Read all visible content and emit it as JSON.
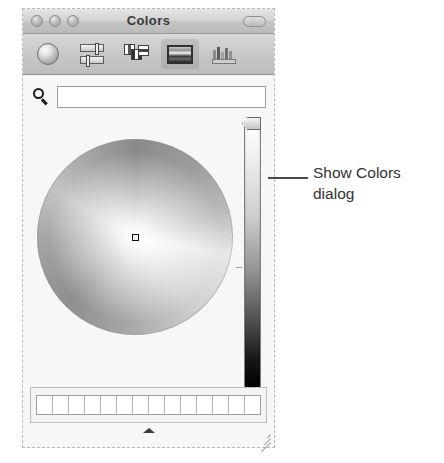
{
  "window": {
    "title": "Colors",
    "traffic_lights": [
      "close-button",
      "minimize-button",
      "zoom-button"
    ],
    "toolbar_toggle": "toolbar-pill-button"
  },
  "toolbar": {
    "items": [
      {
        "name": "color-wheel-icon",
        "label": "Color Wheel",
        "selected": false
      },
      {
        "name": "color-sliders-icon",
        "label": "Color Sliders",
        "selected": false
      },
      {
        "name": "color-palettes-icon",
        "label": "Color Palettes",
        "selected": false
      },
      {
        "name": "image-palettes-icon",
        "label": "Image Palettes",
        "selected": true
      },
      {
        "name": "pencils-icon",
        "label": "Pencils",
        "selected": false
      }
    ]
  },
  "search": {
    "icon": "search-icon",
    "value": "",
    "placeholder": ""
  },
  "color_wheel": {
    "name": "color-wheel-picker",
    "picker_marker": "color-picker-marker",
    "mode": "grayscale"
  },
  "brightness_slider": {
    "name": "brightness-slider",
    "orientation": "vertical",
    "thumb_position_percent": 100,
    "top_color": "#ffffff",
    "bottom_color": "#000000"
  },
  "swatches": {
    "count": 14,
    "color": "#ffffff"
  },
  "grip": {
    "expand_handle": "expand-handle",
    "resize": "resize-grip"
  },
  "callout": {
    "line1": "Show Colors",
    "line2": "dialog",
    "leader": "callout-leader-line"
  },
  "colors": {
    "titlebar_top": "#e6e6e6",
    "titlebar_bottom": "#b9b9b9",
    "toolbar_bg": "#c8c8c8",
    "body_bg": "#f7f7f7",
    "text": "#333333",
    "field_bg": "#ffffff"
  }
}
